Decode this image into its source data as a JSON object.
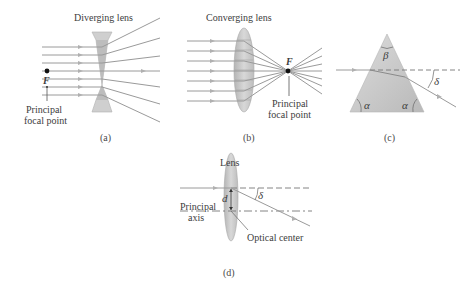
{
  "panels": {
    "a": {
      "title": "Diverging lens",
      "focal_symbol": "F",
      "focal_label_line1": "Principal",
      "focal_label_line2": "focal point",
      "caption": "(a)"
    },
    "b": {
      "title": "Converging lens",
      "focal_symbol": "F",
      "focal_label_line1": "Principal",
      "focal_label_line2": "focal point",
      "caption": "(b)"
    },
    "c": {
      "apex_angle": "β",
      "base_angle_left": "α",
      "base_angle_right": "α",
      "deviation_angle": "δ",
      "caption": "(c)"
    },
    "d": {
      "title": "Lens",
      "axis_label_line1": "Principal",
      "axis_label_line2": "axis",
      "offset_symbol": "d",
      "deviation_angle": "δ",
      "center_label": "Optical center",
      "caption": "(d)"
    }
  },
  "colors": {
    "ray": "#9a9a9a",
    "lens_fill": "#c8c8c8",
    "prism_fill": "#cfcfcf",
    "text": "#3d3d3d",
    "focal_dot": "#111111"
  }
}
